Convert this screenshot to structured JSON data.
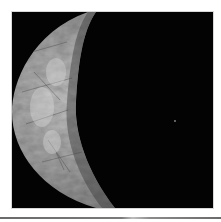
{
  "image": {
    "subject": "crescent moon",
    "description": "Gray, textured crescent of a moon lit from the left against a black background; a faint point of light at right",
    "colors": {
      "background": "#030303",
      "surface_light": "#cfcfcf",
      "surface_mid": "#9a9a9a",
      "surface_dark": "#5e5e5e",
      "border": "#ffffff"
    }
  }
}
